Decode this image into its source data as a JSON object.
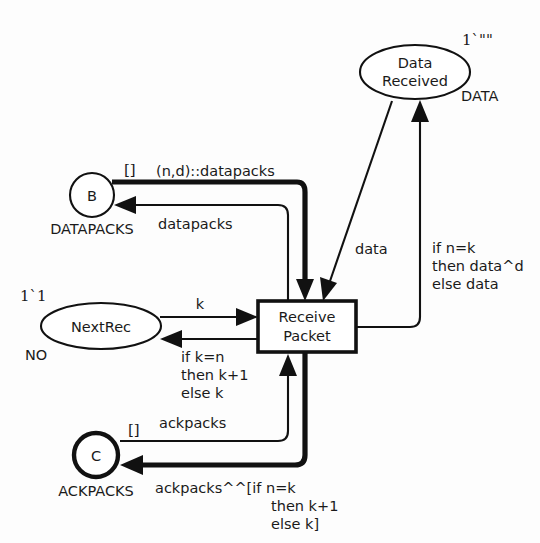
{
  "diagram": {
    "kind": "coloured-petri-net",
    "title": "Receive Packet",
    "background_color": "#fdfdfd",
    "line_color": "#111111"
  },
  "places": [
    {
      "id": "data_received",
      "label_line1": "Data",
      "label_line2": "Received",
      "type": "DATA",
      "marking": "1`\"\"",
      "shape": "ellipse",
      "border": "thin"
    },
    {
      "id": "b",
      "label_line1": "B",
      "label_line2": "",
      "type": "DATAPACKS",
      "marking": "[]",
      "shape": "circle",
      "border": "thin"
    },
    {
      "id": "nextrec",
      "label_line1": "NextRec",
      "label_line2": "",
      "type": "NO",
      "marking": "1`1",
      "shape": "ellipse",
      "border": "thin"
    },
    {
      "id": "c",
      "label_line1": "C",
      "label_line2": "",
      "type": "ACKPACKS",
      "marking": "[]",
      "shape": "circle",
      "border": "thick"
    }
  ],
  "transitions": [
    {
      "id": "receive_packet",
      "label_line1": "Receive",
      "label_line2": "Packet"
    }
  ],
  "arcs": [
    {
      "id": "b_to_transition",
      "from": "b",
      "to": "receive_packet",
      "weight": "thick",
      "label": "(n,d)::datapacks"
    },
    {
      "id": "transition_to_b",
      "from": "receive_packet",
      "to": "b",
      "weight": "thin",
      "label": "datapacks"
    },
    {
      "id": "transition_to_data_received",
      "from": "receive_packet",
      "to": "data_received",
      "weight": "thin",
      "label_line1": "if n=k",
      "label_line2": "then data^d",
      "label_line3": "else data"
    },
    {
      "id": "data_received_to_transition",
      "from": "data_received",
      "to": "receive_packet",
      "weight": "thin",
      "label": "data"
    },
    {
      "id": "nextrec_to_transition",
      "from": "nextrec",
      "to": "receive_packet",
      "weight": "thin",
      "label": "k"
    },
    {
      "id": "transition_to_nextrec",
      "from": "receive_packet",
      "to": "nextrec",
      "weight": "thin",
      "label_line1": "if k=n",
      "label_line2": "then k+1",
      "label_line3": "else k"
    },
    {
      "id": "c_to_transition",
      "from": "c",
      "to": "receive_packet",
      "weight": "thin",
      "label": "ackpacks"
    },
    {
      "id": "transition_to_c",
      "from": "receive_packet",
      "to": "c",
      "weight": "thick",
      "label_line1": "ackpacks^^[if n=k",
      "label_line2": "then k+1",
      "label_line3": "else k]"
    }
  ]
}
